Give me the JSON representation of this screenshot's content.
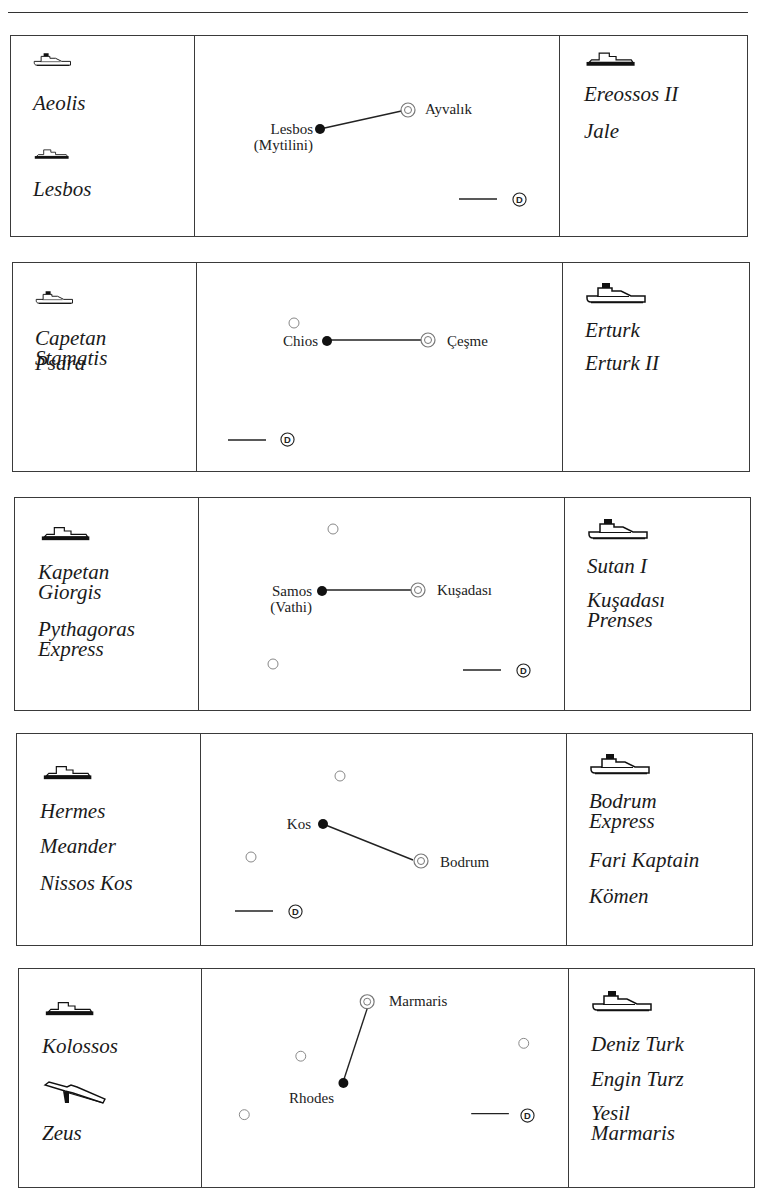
{
  "icons": {
    "ferry_outline": "ferry-outline-icon",
    "ferry_solid": "ferry-solid-hull-icon",
    "hydrofoil": "hydrofoil-icon",
    "departure_marker": "circled-D-icon",
    "greek_port": "filled-dot",
    "turkish_port": "double-circle",
    "other_island": "hollow-circle"
  },
  "routes": [
    {
      "greek_port": "Lesbos",
      "greek_port_sub": "(Mytilini)",
      "turkish_port": "Ayvalık",
      "left_ships": [
        {
          "icon": "ferry_outline",
          "names": [
            "Aeolis"
          ]
        },
        {
          "icon": "ferry_solid",
          "names": [
            "Lesbos"
          ]
        }
      ],
      "right_ships": [
        {
          "icon": "ferry_solid",
          "names": [
            "Ereossos II",
            "Jale"
          ]
        }
      ],
      "legend_symbol": "D"
    },
    {
      "greek_port": "Chios",
      "greek_port_sub": "",
      "turkish_port": "Çeşme",
      "left_ships": [
        {
          "icon": "ferry_outline",
          "names": [
            "Capetan\nStamatis",
            "Psara"
          ]
        }
      ],
      "right_ships": [
        {
          "icon": "ferry_outline",
          "names": [
            "Erturk",
            "Erturk II"
          ]
        }
      ],
      "legend_symbol": "D"
    },
    {
      "greek_port": "Samos",
      "greek_port_sub": "(Vathi)",
      "turkish_port": "Kuşadası",
      "left_ships": [
        {
          "icon": "ferry_solid",
          "names": [
            "Kapetan\nGiorgis",
            "Pythagoras\nExpress"
          ]
        }
      ],
      "right_ships": [
        {
          "icon": "ferry_outline",
          "names": [
            "Sutan I",
            "Kuşadası\nPrenses"
          ]
        }
      ],
      "legend_symbol": "D"
    },
    {
      "greek_port": "Kos",
      "greek_port_sub": "",
      "turkish_port": "Bodrum",
      "left_ships": [
        {
          "icon": "ferry_solid",
          "names": [
            "Hermes",
            "Meander",
            "Nissos Kos"
          ]
        }
      ],
      "right_ships": [
        {
          "icon": "ferry_outline",
          "names": [
            "Bodrum\nExpress",
            "Fari Kaptain",
            "Kömen"
          ]
        }
      ],
      "legend_symbol": "D"
    },
    {
      "greek_port": "Rhodes",
      "greek_port_sub": "",
      "turkish_port": "Marmaris",
      "left_ships": [
        {
          "icon": "ferry_solid",
          "names": [
            "Kolossos"
          ]
        },
        {
          "icon": "hydrofoil",
          "names": [
            "Zeus"
          ]
        }
      ],
      "right_ships": [
        {
          "icon": "ferry_outline",
          "names": [
            "Deniz Turk",
            "Engin Turz",
            "Yesil\nMarmaris"
          ]
        }
      ],
      "legend_symbol": "D"
    }
  ]
}
